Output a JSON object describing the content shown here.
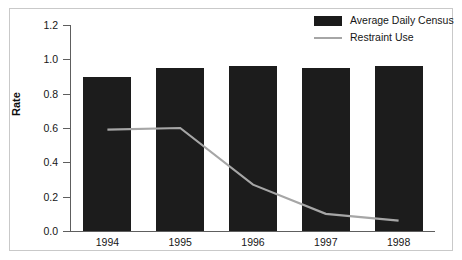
{
  "chart_data": {
    "type": "bar",
    "title": "",
    "xlabel": "",
    "ylabel": "Rate",
    "categories": [
      "1994",
      "1995",
      "1996",
      "1997",
      "1998"
    ],
    "ylim": [
      0.0,
      1.2
    ],
    "ytick_labels": [
      "0.0",
      "0.2",
      "0.4",
      "0.6",
      "0.8",
      "1.0",
      "1.2"
    ],
    "ytick_values": [
      0.0,
      0.2,
      0.4,
      0.6,
      0.8,
      1.0,
      1.2
    ],
    "grid": false,
    "legend_position": "top-right",
    "series": [
      {
        "name": "Average Daily Census",
        "type": "bar",
        "color": "#1c1c1c",
        "values": [
          0.9,
          0.95,
          0.96,
          0.95,
          0.96
        ]
      },
      {
        "name": "Restraint Use",
        "type": "line",
        "color": "#a6a6a6",
        "values": [
          0.59,
          0.6,
          0.27,
          0.1,
          0.06
        ]
      }
    ]
  },
  "legend": {
    "entries": [
      {
        "label": "Average Daily Census",
        "key": "black-square-swatch"
      },
      {
        "label": "Restraint Use",
        "key": "grey-line-swatch"
      }
    ]
  },
  "axes": {
    "y_title": "Rate"
  }
}
